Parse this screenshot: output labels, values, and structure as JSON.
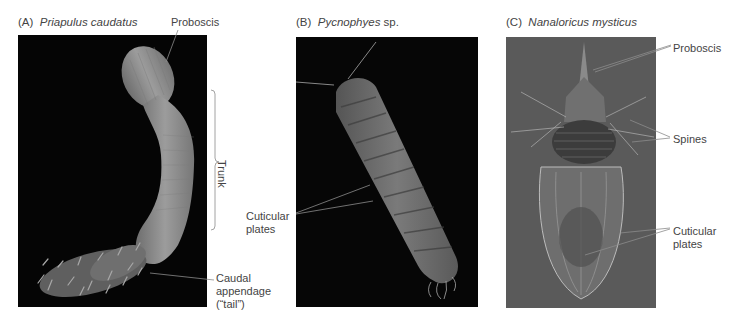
{
  "panels": [
    {
      "id": "A",
      "letter": "(A)",
      "species": "Priapulus caudatus",
      "species_suffix": "",
      "background": "#050505",
      "labels": {
        "proboscis": "Proboscis",
        "trunk": "Trunk",
        "caudal_line1": "Caudal",
        "caudal_line2": "appendage",
        "caudal_line3": "(“tail”)"
      }
    },
    {
      "id": "B",
      "letter": "(B)",
      "species": "Pycnophyes",
      "species_suffix": " sp.",
      "background": "#060606",
      "labels": {
        "cuticular_line1": "Cuticular",
        "cuticular_line2": "plates"
      }
    },
    {
      "id": "C",
      "letter": "(C)",
      "species": "Nanaloricus mysticus",
      "species_suffix": "",
      "background": "#5a5a5a",
      "labels": {
        "proboscis": "Proboscis",
        "spines": "Spines",
        "cuticular_line1": "Cuticular",
        "cuticular_line2": "plates"
      }
    }
  ],
  "colors": {
    "label_text": "#444444",
    "leader_line": "#888888",
    "worm_a": "#8e8e8e",
    "worm_b": "#6f6f6f",
    "worm_c": "#9a9a9a"
  }
}
